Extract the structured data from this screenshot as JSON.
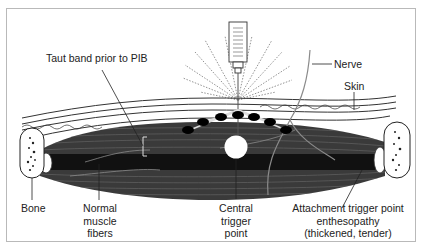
{
  "diagram": {
    "type": "anatomical-illustration",
    "colors": {
      "frame_border": "#b9b9b9",
      "muscle_dark": "#1c1c1c",
      "muscle_fiber": "#4a4a4a",
      "nerve": "#8a8a8a",
      "label_text": "#222222",
      "background": "#ffffff"
    },
    "labels": {
      "taut_band": "Taut band prior to PIB",
      "nerve": "Nerve",
      "skin": "Skin",
      "bone": "Bone",
      "normal_fibers": [
        "Normal",
        "muscle",
        "fibers"
      ],
      "central_tp": [
        "Central",
        "trigger",
        "point"
      ],
      "attachment_tp": [
        "Attachment trigger point",
        "enthesopathy",
        "(thickened, tender)"
      ]
    }
  }
}
